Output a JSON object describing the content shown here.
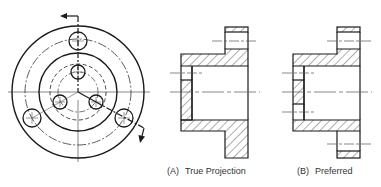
{
  "diagram": {
    "colors": {
      "line": "#1a1a1a",
      "thin_line": "#555555",
      "background": "#ffffff",
      "text": "#333333"
    },
    "front_view": {
      "name": "circular-end-view",
      "center": [
        78,
        92
      ],
      "outer_circle_r": 66,
      "bolt_circle_r": 53,
      "hub_circle_r": 39,
      "inner_hidden_circle_r": 28,
      "inner_hole_circle_r": 20,
      "outer_holes": [
        {
          "cx": 78,
          "cy": 41,
          "r": 9
        },
        {
          "cx": 32,
          "cy": 118,
          "r": 9
        },
        {
          "cx": 124,
          "cy": 118,
          "r": 9
        }
      ],
      "inner_holes": [
        {
          "cx": 78,
          "cy": 72,
          "r": 7
        },
        {
          "cx": 60,
          "cy": 102,
          "r": 7
        },
        {
          "cx": 96,
          "cy": 102,
          "r": 7
        }
      ],
      "cutting_plane": "offset section line with arrows"
    },
    "views": [
      {
        "id": "A",
        "tag": "(A)",
        "label": "True Projection"
      },
      {
        "id": "B",
        "tag": "(B)",
        "label": "Preferred"
      }
    ]
  }
}
